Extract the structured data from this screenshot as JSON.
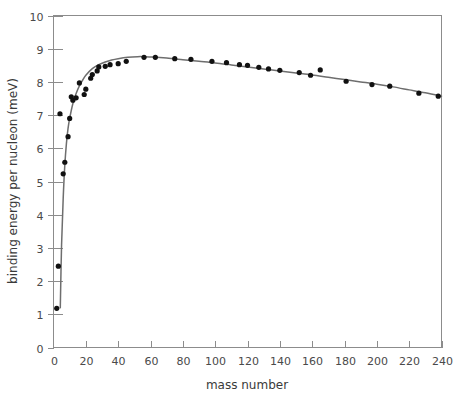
{
  "chart_data": {
    "type": "scatter",
    "title": "",
    "subtitle": "",
    "xlabel": "mass number",
    "ylabel": "binding energy per nucleon (meV)",
    "xlim": [
      0,
      240
    ],
    "ylim": [
      0,
      10
    ],
    "xticks": [
      0,
      20,
      40,
      60,
      80,
      100,
      120,
      140,
      160,
      180,
      200,
      220,
      240
    ],
    "xtick_labels": [
      "0",
      "20",
      "40",
      "60",
      "80",
      "100",
      "120",
      "140",
      "160",
      "180",
      "200",
      "220",
      "240"
    ],
    "yticks": [
      0,
      1,
      2,
      3,
      4,
      5,
      6,
      7,
      8,
      9,
      10
    ],
    "ytick_labels": [
      "0",
      "1",
      "2",
      "3",
      "4",
      "5",
      "6",
      "7",
      "8",
      "9",
      "10"
    ],
    "grid": false,
    "legend": false,
    "legend_position": "none",
    "axis_color": "#8c8c8c",
    "point_color": "#111111",
    "curve_color": "#6e6e6e",
    "series": [
      {
        "name": "measured nuclides",
        "marker": "circle",
        "x": [
          2,
          3,
          4,
          6,
          7,
          9,
          10,
          11,
          12,
          14,
          16,
          19,
          20,
          23,
          24,
          27,
          28,
          32,
          35,
          40,
          45,
          56,
          63,
          75,
          85,
          98,
          107,
          115,
          120,
          127,
          133,
          140,
          152,
          159,
          165,
          181,
          197,
          208,
          226,
          238
        ],
        "y": [
          1.18,
          2.45,
          7.04,
          5.23,
          5.58,
          6.35,
          6.9,
          7.55,
          7.45,
          7.52,
          7.97,
          7.62,
          7.78,
          8.11,
          8.22,
          8.33,
          8.45,
          8.47,
          8.52,
          8.55,
          8.62,
          8.74,
          8.74,
          8.7,
          8.68,
          8.62,
          8.58,
          8.52,
          8.5,
          8.44,
          8.39,
          8.35,
          8.28,
          8.2,
          8.36,
          8.02,
          7.92,
          7.87,
          7.66,
          7.57
        ]
      }
    ],
    "fit_curve": {
      "name": "smooth fit",
      "x": [
        4.2,
        5,
        6,
        7,
        8,
        9,
        10,
        12,
        14,
        16,
        18,
        20,
        24,
        28,
        32,
        36,
        40,
        46,
        52,
        56,
        62,
        70,
        80,
        90,
        100,
        110,
        120,
        130,
        140,
        150,
        160,
        170,
        180,
        190,
        200,
        210,
        220,
        230,
        240
      ],
      "y": [
        1.2,
        3.1,
        4.5,
        5.5,
        6.15,
        6.6,
        6.9,
        7.35,
        7.65,
        7.88,
        8.05,
        8.2,
        8.4,
        8.52,
        8.6,
        8.66,
        8.7,
        8.74,
        8.76,
        8.76,
        8.75,
        8.72,
        8.67,
        8.62,
        8.57,
        8.51,
        8.45,
        8.39,
        8.33,
        8.27,
        8.21,
        8.14,
        8.07,
        8.0,
        7.93,
        7.85,
        7.76,
        7.67,
        7.57
      ]
    },
    "annotations": []
  },
  "axes": {
    "x_title": "mass number",
    "y_title": "binding energy per nucleon (meV)"
  }
}
